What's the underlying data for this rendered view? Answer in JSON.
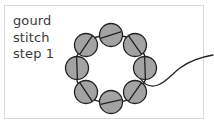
{
  "panel": {
    "border_color": "#d9d9d9",
    "background_color": "#ffffff"
  },
  "caption": {
    "line1": "gourd",
    "line2": "stitch",
    "line3": "step 1",
    "color": "#3a3a3a"
  },
  "diagram": {
    "title": "gourd stitch step 1",
    "bead_fill": "#a3a3a3",
    "bead_stroke": "#222222",
    "thread_color": "#222222",
    "bead_count": 8,
    "bead_radius": 11.5,
    "ring_center": [
      111,
      68
    ],
    "ring_radius": 33,
    "beads": [
      {
        "id": "bead-top",
        "cx": 111,
        "cy": 35,
        "angle": -18
      },
      {
        "id": "bead-top-right",
        "cx": 135,
        "cy": 45,
        "angle": 55
      },
      {
        "id": "bead-right",
        "cx": 145,
        "cy": 68,
        "angle": 88
      },
      {
        "id": "bead-bottom-right",
        "cx": 135,
        "cy": 92,
        "angle": 125
      },
      {
        "id": "bead-bottom",
        "cx": 111,
        "cy": 102,
        "angle": 168
      },
      {
        "id": "bead-bottom-left",
        "cx": 86,
        "cy": 92,
        "angle": 215
      },
      {
        "id": "bead-left",
        "cx": 77,
        "cy": 68,
        "angle": 268
      },
      {
        "id": "bead-top-left",
        "cx": 86,
        "cy": 45,
        "angle": 310
      }
    ],
    "thread_ring_path": "M 111 35 C 124 35 134 39 139 46 C 144 52 147 60 147 68 C 147 77 144 86 138 92 C 132 99 122 103 111 103 C 100 103 90 99 84 92 C 78 86 75 77 75 68 C 75 59 78 51 84 45 C 90 38 99 35 111 35 Z",
    "thread_tail_path": "M 140 78 C 144 84 150 88 158 85 C 166 82 172 74 180 68 C 188 62 196 58 213 55"
  }
}
